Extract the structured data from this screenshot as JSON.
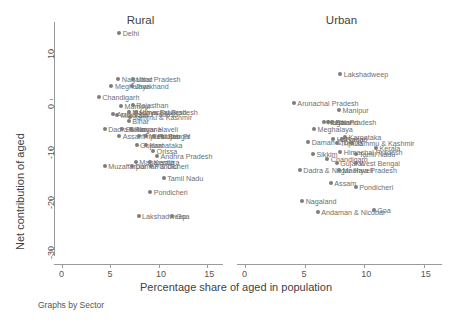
{
  "figure": {
    "caption": "Graphs by Sector",
    "xlabel": "Percentage share of aged in population",
    "ylabel": "Net contribution of aged",
    "marker_color": "#7d7d7d",
    "label_color": "#6f6f6f"
  },
  "chart_data": {
    "type": "scatter",
    "title": "",
    "xlabel": "Percentage share of aged in population",
    "ylabel": "Net contribution of aged",
    "xlim": [
      0,
      16.2
    ],
    "ylim": [
      -31.5,
      15.5
    ],
    "xticks": [
      0,
      5,
      10,
      15
    ],
    "yticks": [
      10,
      0,
      -10,
      -20,
      -30
    ],
    "grid": false,
    "legend": false,
    "facet_by": "Sector",
    "panels": [
      {
        "name": "Rural",
        "points": [
          {
            "label": "Delhi",
            "x": 5.9,
            "y": 13.2
          },
          {
            "label": "Nagaland",
            "x": 5.8,
            "y": 4.1
          },
          {
            "label": "Uttar Pradesh",
            "x": 7.3,
            "y": 4.1
          },
          {
            "label": "Meghalaya",
            "x": 5.1,
            "y": 2.6
          },
          {
            "label": "Jharkhand",
            "x": 7.2,
            "y": 2.6
          },
          {
            "label": "Chandigarh",
            "x": 3.8,
            "y": 0.4
          },
          {
            "label": "Manipur",
            "x": 6.1,
            "y": -1.3
          },
          {
            "label": "Rajasthan",
            "x": 7.3,
            "y": -1.1
          },
          {
            "label": "Arunachal Pradesh",
            "x": 5.3,
            "y": -3.0
          },
          {
            "label": "Madhya Pradesh",
            "x": 6.9,
            "y": -2.6
          },
          {
            "label": "Himachal Pradesh",
            "x": 7.6,
            "y": -2.6
          },
          {
            "label": "Mizoram",
            "x": 5.7,
            "y": -3.2
          },
          {
            "label": "Jammu & Kashmir",
            "x": 7.0,
            "y": -3.6
          },
          {
            "label": "Bihar",
            "x": 6.9,
            "y": -4.4
          },
          {
            "label": "Dadra & Nagar Haveli",
            "x": 4.4,
            "y": -6.0
          },
          {
            "label": "Sikkim",
            "x": 6.2,
            "y": -6.0
          },
          {
            "label": "Haryana",
            "x": 7.1,
            "y": -6.0
          },
          {
            "label": "Assam",
            "x": 5.9,
            "y": -7.4
          },
          {
            "label": "Tripura",
            "x": 7.9,
            "y": -7.3
          },
          {
            "label": "West Bengal",
            "x": 8.7,
            "y": -7.3
          },
          {
            "label": "Punjab",
            "x": 9.5,
            "y": -7.3
          },
          {
            "label": "Uttar Pr",
            "x": 10.3,
            "y": -7.3
          },
          {
            "label": "Gujarat",
            "x": 7.7,
            "y": -9.3
          },
          {
            "label": "Karnataka",
            "x": 8.7,
            "y": -9.3
          },
          {
            "label": "Orissa",
            "x": 9.4,
            "y": -10.4
          },
          {
            "label": "Andhra Pradesh",
            "x": 9.8,
            "y": -11.4
          },
          {
            "label": "Maharashtra",
            "x": 7.6,
            "y": -12.6
          },
          {
            "label": "Kerala",
            "x": 9.1,
            "y": -12.6
          },
          {
            "label": "Muzaffarpur",
            "x": 4.4,
            "y": -13.4
          },
          {
            "label": "Daman & Diu",
            "x": 7.2,
            "y": -13.4
          },
          {
            "label": "Pondicheri",
            "x": 9.2,
            "y": -13.4
          },
          {
            "label": "Tamil Nadu",
            "x": 10.5,
            "y": -15.9
          },
          {
            "label": "Pondicheri",
            "x": 9.1,
            "y": -18.6
          },
          {
            "label": "Lakshadweep",
            "x": 7.9,
            "y": -23.5
          },
          {
            "label": "Goa",
            "x": 11.4,
            "y": -23.5
          }
        ]
      },
      {
        "name": "Urban",
        "points": [
          {
            "label": "Lakshadweep",
            "x": 8.0,
            "y": 5.1
          },
          {
            "label": "Arunachal Pradesh",
            "x": 4.1,
            "y": -0.7
          },
          {
            "label": "Manipur",
            "x": 7.9,
            "y": -2.1
          },
          {
            "label": "Uttar Pradesh",
            "x": 7.0,
            "y": -4.6
          },
          {
            "label": "Nagaland",
            "x": 6.6,
            "y": -4.6
          },
          {
            "label": "Bihar",
            "x": 7.3,
            "y": -4.6
          },
          {
            "label": "Meghalaya",
            "x": 5.8,
            "y": -6.0
          },
          {
            "label": "Karnataka",
            "x": 8.4,
            "y": -7.6
          },
          {
            "label": "Daman & Diu",
            "x": 5.3,
            "y": -8.6
          },
          {
            "label": "Haryana",
            "x": 7.4,
            "y": -8.1
          },
          {
            "label": "Punjab",
            "x": 8.1,
            "y": -8.1
          },
          {
            "label": "Tripura",
            "x": 7.7,
            "y": -8.9
          },
          {
            "label": "Jammu & Kashmir",
            "x": 9.0,
            "y": -8.9
          },
          {
            "label": "Kerala",
            "x": 11.0,
            "y": -9.9
          },
          {
            "label": "Sikkim",
            "x": 5.7,
            "y": -11.0
          },
          {
            "label": "Himachal Pradesh",
            "x": 8.0,
            "y": -10.6
          },
          {
            "label": "Tamil Nadu",
            "x": 9.3,
            "y": -11.0
          },
          {
            "label": "Chandigarh",
            "x": 6.9,
            "y": -12.0
          },
          {
            "label": "Gujarat",
            "x": 7.7,
            "y": -12.9
          },
          {
            "label": "West Bengal",
            "x": 9.3,
            "y": -12.9
          },
          {
            "label": "Dadra & Nagar Haveli",
            "x": 4.6,
            "y": -14.3
          },
          {
            "label": "Madhya Pradesh",
            "x": 7.9,
            "y": -14.3
          },
          {
            "label": "Assam",
            "x": 7.2,
            "y": -16.9
          },
          {
            "label": "Pondicheri",
            "x": 9.3,
            "y": -17.7
          },
          {
            "label": "Nagaland",
            "x": 4.8,
            "y": -20.5
          },
          {
            "label": "Andaman & Nicobar",
            "x": 6.1,
            "y": -22.6
          },
          {
            "label": "Goa",
            "x": 10.8,
            "y": -22.3
          }
        ]
      }
    ]
  }
}
